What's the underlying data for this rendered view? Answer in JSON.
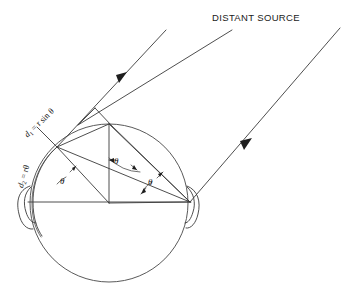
{
  "figure": {
    "title_label": "DISTANT SOURCE",
    "background_color": "#ffffff",
    "line_color": "#3a3a3a",
    "arrow_color": "#1e1e1e",
    "labels": {
      "d1_prefix": "d",
      "d1_sub": "1",
      "d1_expr": " = r sin θ",
      "d2_prefix": "d",
      "d2_sub": "2",
      "d2_expr": " = rθ",
      "theta_left": "θ",
      "theta_center": "θ",
      "theta_right": "θ"
    },
    "geometry": {
      "head_center_x": 109,
      "head_center_y": 203,
      "head_radius": 79,
      "ray_angle_degrees": 50,
      "ray_count": 3
    }
  }
}
